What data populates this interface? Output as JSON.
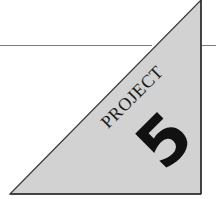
{
  "badge": {
    "title": "PROJECT",
    "number": "5"
  },
  "colors": {
    "triangle_fill": "#d2d2d2",
    "triangle_stroke": "#3a3a3a",
    "rule": "#7a7a7a",
    "text": "#1a1a1a",
    "background": "#ffffff"
  }
}
